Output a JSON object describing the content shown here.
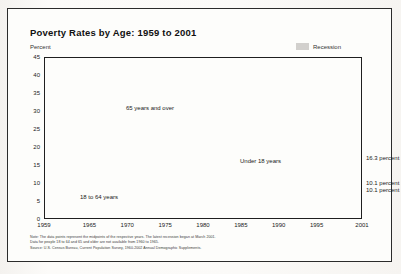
{
  "chart_data": {
    "type": "line",
    "title": "Poverty Rates by Age:  1959 to 2001",
    "ylabel": "Percent",
    "xlabel": "",
    "ylim": [
      0,
      45
    ],
    "xlim": [
      1959,
      2001
    ],
    "ytick_step": 5,
    "yticks": [
      "0",
      "5",
      "10",
      "15",
      "20",
      "25",
      "30",
      "35",
      "40",
      "45"
    ],
    "xticks": [
      "1959",
      "1965",
      "1970",
      "1975",
      "1980",
      "1985",
      "1990",
      "1995",
      "2001"
    ],
    "xtick_values": [
      1959,
      1965,
      1970,
      1975,
      1980,
      1985,
      1990,
      1995,
      2001
    ],
    "grid": "horizontal",
    "legend_position": "top-right",
    "legend": [
      {
        "label": "Recession",
        "color": "#d2d0cd",
        "style": "shaded-band"
      }
    ],
    "series": [
      {
        "name": "65 years and over",
        "color": "#8c8c8c",
        "label_text": "65 years and over",
        "dashed_until": 1966,
        "note": "dotted 1959-1966 (interpolated), solid thereafter",
        "x": [
          1959,
          1960,
          1961,
          1962,
          1963,
          1964,
          1965,
          1966,
          1967,
          1968,
          1969,
          1970,
          1971,
          1972,
          1973,
          1974,
          1975,
          1976,
          1977,
          1978,
          1979,
          1980,
          1981,
          1982,
          1983,
          1984,
          1985,
          1986,
          1987,
          1988,
          1989,
          1990,
          1991,
          1992,
          1993,
          1994,
          1995,
          1996,
          1997,
          1998,
          1999,
          2000,
          2001
        ],
        "values": [
          35.2,
          34.6,
          34.0,
          33.4,
          32.8,
          32.2,
          31.6,
          28.5,
          29.5,
          25.0,
          25.3,
          24.6,
          21.6,
          18.6,
          16.3,
          14.6,
          15.3,
          15.0,
          14.1,
          14.0,
          15.2,
          15.7,
          15.3,
          14.6,
          13.8,
          12.4,
          12.6,
          12.4,
          12.5,
          12.0,
          11.4,
          12.2,
          12.4,
          12.9,
          12.2,
          11.7,
          10.5,
          10.8,
          10.5,
          10.5,
          9.7,
          9.9,
          10.1
        ],
        "endpoint_label": "10.1 percent"
      },
      {
        "name": "Under 18 years",
        "color": "#1a1a1a",
        "label_text": "Under 18 years",
        "x": [
          1959,
          1960,
          1961,
          1962,
          1963,
          1964,
          1965,
          1966,
          1967,
          1968,
          1969,
          1970,
          1971,
          1972,
          1973,
          1974,
          1975,
          1976,
          1977,
          1978,
          1979,
          1980,
          1981,
          1982,
          1983,
          1984,
          1985,
          1986,
          1987,
          1988,
          1989,
          1990,
          1991,
          1992,
          1993,
          1994,
          1995,
          1996,
          1997,
          1998,
          1999,
          2000,
          2001
        ],
        "values": [
          27.3,
          26.9,
          25.6,
          25.0,
          23.1,
          23.0,
          21.0,
          17.6,
          16.6,
          15.6,
          14.0,
          15.1,
          15.3,
          15.1,
          14.4,
          15.4,
          17.1,
          16.0,
          16.2,
          15.9,
          16.4,
          18.3,
          20.0,
          21.9,
          22.3,
          21.5,
          20.7,
          20.5,
          20.3,
          19.5,
          19.6,
          20.6,
          21.8,
          22.3,
          22.7,
          21.8,
          20.8,
          20.5,
          19.9,
          18.9,
          16.9,
          16.2,
          16.3
        ],
        "endpoint_label": "16.3 percent"
      },
      {
        "name": "18 to 64 years",
        "color": "#1a1a1a",
        "label_text": "18 to 64 years",
        "dashed_until": 1966,
        "note": "dotted 1959-1966 (interpolated), solid thereafter",
        "x": [
          1959,
          1960,
          1961,
          1962,
          1963,
          1964,
          1965,
          1966,
          1967,
          1968,
          1969,
          1970,
          1971,
          1972,
          1973,
          1974,
          1975,
          1976,
          1977,
          1978,
          1979,
          1980,
          1981,
          1982,
          1983,
          1984,
          1985,
          1986,
          1987,
          1988,
          1989,
          1990,
          1991,
          1992,
          1993,
          1994,
          1995,
          1996,
          1997,
          1998,
          1999,
          2000,
          2001
        ],
        "values": [
          17.0,
          16.6,
          16.2,
          15.8,
          15.4,
          15.0,
          14.6,
          13.0,
          12.4,
          11.8,
          11.2,
          10.5,
          10.3,
          9.8,
          9.3,
          9.1,
          9.7,
          9.4,
          9.3,
          9.0,
          9.1,
          10.1,
          11.1,
          12.0,
          12.4,
          11.7,
          11.3,
          10.8,
          10.6,
          10.4,
          10.2,
          10.7,
          11.4,
          11.9,
          12.4,
          11.9,
          11.4,
          11.4,
          10.9,
          10.5,
          10.0,
          9.6,
          10.1
        ],
        "endpoint_label": "10.1 percent"
      }
    ],
    "recession_bands": [
      {
        "start": 1960.3,
        "end": 1961.2
      },
      {
        "start": 1969.9,
        "end": 1970.9
      },
      {
        "start": 1973.9,
        "end": 1975.2
      },
      {
        "start": 1980.1,
        "end": 1980.6
      },
      {
        "start": 1981.5,
        "end": 1982.9
      },
      {
        "start": 1990.6,
        "end": 1991.2
      },
      {
        "start": 2001.2,
        "end": 2001.9
      }
    ],
    "annotations": [
      {
        "text": "65 years and over",
        "x_px": 82,
        "y_px": 48
      },
      {
        "text": "Under 18 years",
        "x_px": 196,
        "y_px": 101
      },
      {
        "text": "18 to 64 years",
        "x_px": 36,
        "y_px": 137
      }
    ],
    "endpoint_callouts": [
      {
        "text": "16.3 percent",
        "top_px": 155
      },
      {
        "text": "10.1 percent",
        "top_px": 180
      },
      {
        "text": "10.1 percent",
        "top_px": 187
      }
    ]
  },
  "footnotes": {
    "note": "Note:  The data points represent the midpoints of the respective years.  The latest recession began at March 2001.",
    "note2": "Data for people 18 to 64 and 65 and older are not available from 1960 to 1965.",
    "source": "Source:  U.S. Census Bureau, Current Population Survey, 1960-2002 Annual Demographic Supplements."
  }
}
